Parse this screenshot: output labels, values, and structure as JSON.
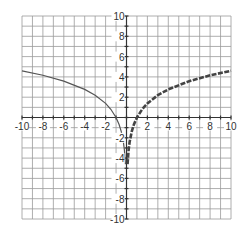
{
  "chart_data": {
    "type": "line",
    "title": "",
    "xlabel": "",
    "ylabel": "",
    "xlim": [
      -10,
      10
    ],
    "ylim": [
      -10,
      10
    ],
    "grid": true,
    "grid_step": 1,
    "x_ticks": [
      -10,
      -8,
      -6,
      -4,
      -2,
      2,
      4,
      6,
      8,
      10
    ],
    "x_tick_labels": [
      "-10",
      "-8",
      "-6",
      "-4",
      "-2",
      "2",
      "4",
      "6",
      "8",
      "10"
    ],
    "y_ticks": [
      10,
      8,
      6,
      4,
      2,
      -2,
      -4,
      -6,
      -8,
      -10
    ],
    "y_tick_labels": [
      "10",
      "8",
      "6",
      "4",
      "2",
      "-2",
      "-4",
      "-6",
      "-8",
      "-10"
    ],
    "series": [
      {
        "name": "left-branch",
        "style": "solid-thin",
        "domain": [
          -10,
          -0.1
        ],
        "x": [
          -10,
          -8,
          -6,
          -4,
          -3,
          -2,
          -1.5,
          -1,
          -0.7,
          -0.5,
          -0.3,
          -0.2,
          -0.1
        ],
        "y": [
          4.6,
          4.16,
          3.58,
          2.77,
          2.2,
          1.39,
          0.81,
          0,
          -0.71,
          -1.39,
          -2.41,
          -3.22,
          -4.6
        ]
      },
      {
        "name": "right-branch",
        "style": "dashed-thick",
        "domain": [
          0.1,
          10
        ],
        "x": [
          0.1,
          0.2,
          0.3,
          0.5,
          0.7,
          1,
          1.5,
          2,
          3,
          4,
          6,
          8,
          10
        ],
        "y": [
          -4.6,
          -3.22,
          -2.41,
          -1.39,
          -0.71,
          0,
          0.81,
          1.39,
          2.2,
          2.77,
          3.58,
          4.16,
          4.6
        ]
      }
    ]
  }
}
